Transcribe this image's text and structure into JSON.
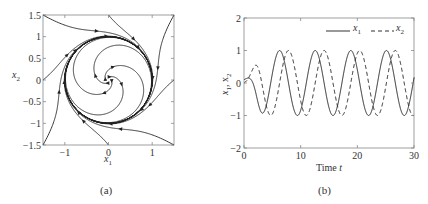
{
  "chart_data": [
    {
      "type": "line",
      "panel": "(a)",
      "title": "",
      "xlabel": "x_1",
      "ylabel": "x_2",
      "xlim": [
        -1.5,
        1.5
      ],
      "ylim": [
        -1.5,
        1.5
      ],
      "xticks": [
        "-1",
        "0",
        "1"
      ],
      "yticks": [
        "1.5",
        "1",
        "0.5",
        "0",
        "-0.5",
        "-1",
        "-1.5"
      ],
      "grid": false,
      "description": "Phase portrait: trajectories spiral from the origin outward and from the box boundary inward, converging to a stable limit cycle of radius 1",
      "limit_cycle_radius": 1,
      "initial_conditions": [
        [
          -1.5,
          1.5
        ],
        [
          0,
          1.5
        ],
        [
          1.5,
          1.5
        ],
        [
          1.5,
          0
        ],
        [
          1.5,
          -1.5
        ],
        [
          0,
          -1.5
        ],
        [
          -1.5,
          -1.5
        ],
        [
          -1.5,
          0
        ],
        [
          0.05,
          0
        ],
        [
          -0.05,
          0
        ],
        [
          0,
          0.05
        ],
        [
          0,
          -0.05
        ]
      ]
    },
    {
      "type": "line",
      "panel": "(b)",
      "title": "",
      "xlabel": "Time t",
      "ylabel": "x_1, x_2",
      "xlim": [
        0,
        30
      ],
      "ylim": [
        -2,
        2
      ],
      "xticks": [
        "0",
        "10",
        "20",
        "30"
      ],
      "yticks": [
        "2",
        "1",
        "0",
        "-1",
        "-2"
      ],
      "grid": false,
      "legend": {
        "position": "upper right",
        "entries": [
          "x_1",
          "x_2"
        ]
      },
      "series": [
        {
          "name": "x_1",
          "style": "solid",
          "description": "starts near 0.1, settles to unit-amplitude oscillation with period ~6.28; peaks near t≈6.3, 12.6, 18.9, 25.2"
        },
        {
          "name": "x_2",
          "style": "dashed",
          "description": "starts near 0, leads x_1 by quarter period; peaks near t≈4.7, 11, 17.3, 23.6"
        }
      ],
      "initial_condition": [
        0.1,
        0.0
      ]
    }
  ],
  "captions": {
    "a": "(a)",
    "b": "(b)"
  },
  "axes_a": {
    "xticks": [
      {
        "v": -1,
        "label": "−1"
      },
      {
        "v": 0,
        "label": "0"
      },
      {
        "v": 1,
        "label": "1"
      }
    ],
    "yticks": [
      {
        "v": 1.5,
        "label": "1.5"
      },
      {
        "v": 1,
        "label": "1"
      },
      {
        "v": 0.5,
        "label": "0.5"
      },
      {
        "v": 0,
        "label": "0"
      },
      {
        "v": -0.5,
        "label": "−0.5"
      },
      {
        "v": -1,
        "label": "−1"
      },
      {
        "v": -1.5,
        "label": "−1.5"
      }
    ],
    "xlabel": "x",
    "xlabel_sub": "1",
    "ylabel": "x",
    "ylabel_sub": "2"
  },
  "axes_b": {
    "xticks": [
      {
        "v": 0,
        "label": "0"
      },
      {
        "v": 10,
        "label": "10"
      },
      {
        "v": 20,
        "label": "20"
      },
      {
        "v": 30,
        "label": "30"
      }
    ],
    "yticks": [
      {
        "v": 2,
        "label": "2"
      },
      {
        "v": 1,
        "label": "1"
      },
      {
        "v": 0,
        "label": "0"
      },
      {
        "v": -1,
        "label": "−1"
      },
      {
        "v": -2,
        "label": "−2"
      }
    ],
    "xlabel": "Time ",
    "xlabel_var": "t",
    "ylabel": "x",
    "legend": {
      "x1": "x",
      "x1_sub": "1",
      "x2": "x",
      "x2_sub": "2"
    }
  }
}
